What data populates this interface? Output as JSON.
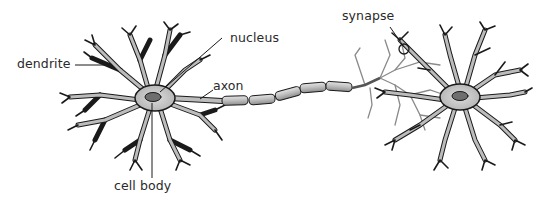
{
  "diagram": {
    "type": "neuron-anatomy",
    "labels": {
      "dendrite": "dendrite",
      "nucleus": "nucleus",
      "axon": "axon",
      "cell_body": "cell body",
      "synapse": "synapse"
    },
    "colors": {
      "stroke": "#1a1a1a",
      "soma_fill": "#c8c8c8",
      "nucleus_fill": "#6e6e6e",
      "axon_segment_fill": "#b4b4b4",
      "terminal_branches": "#8a8a8a",
      "label_text": "#2a2a2a"
    }
  }
}
